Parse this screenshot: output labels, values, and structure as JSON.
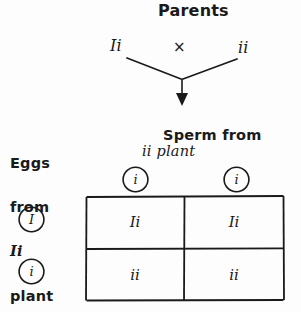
{
  "diagram": {
    "title": "Parents",
    "parents": {
      "left_genotype": "Ii",
      "cross_symbol": "×",
      "right_genotype": "ii"
    },
    "sperm_label": {
      "line1": "Sperm from",
      "line2": "ii plant"
    },
    "eggs_label": {
      "line1": "Eggs",
      "line2": "from",
      "line3": "Ii",
      "line4": "plant"
    },
    "punnett": {
      "column_gametes": [
        "i",
        "i"
      ],
      "row_gametes": [
        "I",
        "i"
      ],
      "cells": [
        [
          "Ii",
          "Ii"
        ],
        [
          "ii",
          "ii"
        ]
      ]
    },
    "colors": {
      "ink": "#1a1a1a",
      "background": "#fdfdfd"
    }
  }
}
